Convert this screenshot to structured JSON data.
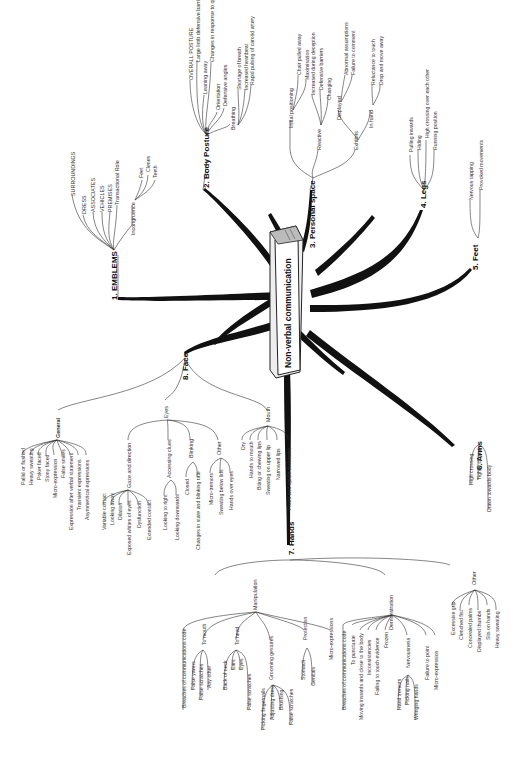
{
  "diagram": {
    "title": "Non-verbal communication",
    "branches": [
      {
        "label": "1. EMBLEMS",
        "children": [
          {
            "label": "SURROUNDINGS"
          },
          {
            "label": "DRESS"
          },
          {
            "label": "ASSOCIATES"
          },
          {
            "label": "VEHICLES"
          },
          {
            "label": "PREMISES"
          },
          {
            "label": "Transactional Role"
          },
          {
            "label": "Incongruence",
            "children": [
              "Feet",
              "Clenes",
              "Teeth"
            ]
          }
        ]
      },
      {
        "label": "2. Body Posture",
        "children": [
          {
            "label": "OVERALL POSTURE"
          },
          {
            "label": "Large limb defensive barriers"
          },
          {
            "label": "Leaning away"
          },
          {
            "label": "Changes in response to questions"
          },
          {
            "label": "Orientation"
          },
          {
            "label": "Defensive angles"
          },
          {
            "label": "Breathing",
            "children": [
              "Shortage of breath",
              "Increased heartbeat",
              "Rapid pulsing of carotid artery"
            ]
          }
        ]
      },
      {
        "label": "3. Personal space",
        "children": [
          {
            "label": "Initial positioning",
            "children": [
              "Chair pulled away",
              "Maximisation"
            ]
          },
          {
            "label": "Reactive",
            "children": [
              "Increased during deception",
              "Defensive barriers",
              "Changing"
            ]
          },
          {
            "label": "Exhibits",
            "children": [
              {
                "label": "Displayed",
                "children": [
                  "Abnormal assumptions",
                  "Failure to comment"
                ]
              },
              {
                "label": "In hand",
                "children": [
                  "Reluctance to touch",
                  "Drop and move away"
                ]
              }
            ]
          }
        ]
      },
      {
        "label": "4. Legs",
        "children": [
          {
            "label": "Pulling inwards"
          },
          {
            "label": "Hiding"
          },
          {
            "label": "High crossing over each other"
          },
          {
            "label": "Running position"
          }
        ]
      },
      {
        "label": "5. Feet",
        "children": [
          {
            "label": "Nervous tapping"
          },
          {
            "label": "Provoked movements"
          }
        ]
      },
      {
        "label": "6. Arms",
        "children": [
          {
            "label": "High crossing"
          },
          {
            "label": "Tightly closed"
          },
          {
            "label": "Drawn towards body"
          }
        ]
      },
      {
        "label": "7. Hands",
        "children": [
          {
            "label": "Manipulation",
            "children": [
              {
                "label": "Breaches of communications code"
              },
              {
                "label": "To mouth",
                "children": [
                  "False yawns",
                  "False scratches",
                  "Any other"
                ]
              },
              {
                "label": "To head",
                "children": [
                  "Back of neck",
                  "Ears",
                  "Eyes",
                  "False scratches"
                ]
              },
              {
                "label": "Grooming gestures",
                "children": [
                  "Picking fingernails",
                  "Adjusting dress",
                  "Brushing",
                  "False scratches"
                ]
              },
              {
                "label": "Protection",
                "children": [
                  "Stomach",
                  "Genitals"
                ]
              },
              {
                "label": "Micro-expressions"
              }
            ]
          },
          {
            "label": "Demonstration",
            "children": [
              {
                "label": "Breaches of communications code"
              },
              {
                "label": "To punctuate"
              },
              {
                "label": "Moving inwards and close to the body"
              },
              {
                "label": "Inconsistencies"
              },
              {
                "label": "Failing to touch evidence"
              },
              {
                "label": "Frozen"
              },
              {
                "label": "Nervousness",
                "children": [
                  "Hand tremors",
                  "Picking nails",
                  "Wringing hands"
                ]
              },
              {
                "label": "Failure to point"
              },
              {
                "label": "Micro-expression"
              }
            ]
          },
          {
            "label": "Other",
            "children": [
              {
                "label": "Excessive grip"
              },
              {
                "label": "Clenched fist"
              },
              {
                "label": "Concealed palms"
              },
              {
                "label": "Displayed thumbs"
              },
              {
                "label": "Sits on hands"
              },
              {
                "label": "Heavy sweating"
              }
            ]
          }
        ]
      },
      {
        "label": "8. Face",
        "children": [
          {
            "label": "General",
            "children": [
              "Pallid or flushed",
              "Heavy sweating",
              "Poker faced",
              "Stony faced",
              "Micro-expression",
              "False smiles",
              "Expression after verbal statement",
              "Transient expressions",
              "Asymmetrical expressions"
            ]
          },
          {
            "label": "Eyes",
            "children": [
              {
                "label": "Gaze and direction",
                "children": [
                  "Variable contact",
                  "Looking away",
                  "Dilation",
                  "Exposed whites of eyes",
                  "Dysfunction",
                  "Extended contact"
                ]
              },
              {
                "label": "Accessing clues",
                "children": [
                  "Looking to right",
                  "Looking downwards"
                ]
              },
              {
                "label": "Blinking",
                "children": [
                  "Closed",
                  "Changes in stare and blinking rate"
                ]
              },
              {
                "label": "Other",
                "children": [
                  "Micro-tremors",
                  "Sweating below lids",
                  "Hands over eyes"
                ]
              }
            ]
          },
          {
            "label": "Mouth",
            "children": [
              "Dry",
              "Hands to mouth",
              "Biting or chewing lips",
              "Sweating on upper lip",
              "Narrowed lips",
              "Foam and spittle in corners"
            ]
          }
        ]
      }
    ]
  }
}
